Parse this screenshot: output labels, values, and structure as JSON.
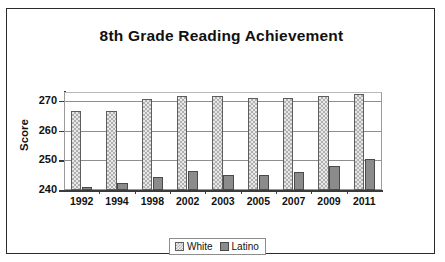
{
  "chart_data": {
    "type": "bar",
    "title": "8th Grade Reading Achievement",
    "xlabel": "",
    "ylabel": "Score",
    "ylim": [
      240,
      273
    ],
    "yticks": [
      240,
      250,
      260,
      270
    ],
    "grid": true,
    "legend_position": "bottom-center",
    "categories": [
      "1992",
      "1994",
      "1998",
      "2002",
      "2003",
      "2005",
      "2007",
      "2009",
      "2011"
    ],
    "series": [
      {
        "name": "White",
        "color": "#e8e8e8",
        "pattern": "checkered",
        "values": [
          266.5,
          266.5,
          270.5,
          271.5,
          271.5,
          271,
          271,
          271.5,
          272.5
        ]
      },
      {
        "name": "Latino",
        "color": "#8b8b8b",
        "pattern": "solid",
        "values": [
          241,
          242.5,
          244.5,
          246.5,
          245,
          245,
          246,
          248,
          250.5
        ]
      }
    ]
  },
  "legend": {
    "entries": [
      {
        "label": "White"
      },
      {
        "label": "Latino"
      }
    ]
  }
}
